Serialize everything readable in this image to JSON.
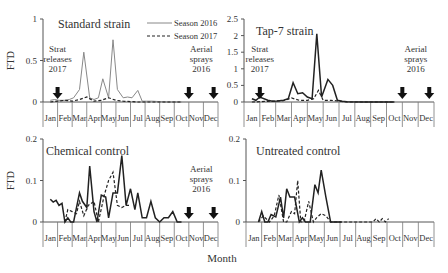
{
  "figure": {
    "xlabel": "Month",
    "ylabel": "FTD"
  },
  "legend": {
    "items": [
      {
        "label": "Season 2016",
        "style": "solid-thin",
        "color": "#888888"
      },
      {
        "label": "Season 2017",
        "style": "dashed",
        "color": "#222222"
      }
    ]
  },
  "months": [
    "Jan",
    "Feb",
    "Mar",
    "Apr",
    "May",
    "Jun",
    "Jul",
    "Aug",
    "Sep",
    "Oct",
    "Nov",
    "Dec"
  ],
  "annotations": {
    "strat": [
      "Strat",
      "releases",
      "2017"
    ],
    "aerial": [
      "Aerial",
      "sprays",
      "2016"
    ]
  },
  "chart_data": [
    {
      "type": "line",
      "title": "Standard strain",
      "xlabel": "",
      "ylabel": "FTD",
      "ylim": [
        0,
        1
      ],
      "yticks": [
        "0",
        "0.5",
        "1"
      ],
      "categories": [
        "Jan",
        "Feb",
        "Mar",
        "Apr",
        "May",
        "Jun",
        "Jul",
        "Aug",
        "Sep",
        "Oct",
        "Nov",
        "Dec"
      ],
      "series": [
        {
          "name": "Season 2016",
          "x": [
            0,
            0.3,
            0.6,
            1,
            1.3,
            1.6,
            2,
            2.3,
            2.7,
            3,
            3.3,
            3.6,
            4,
            4.3,
            4.6,
            5,
            5.3,
            5.6,
            6,
            6.3,
            6.6,
            7,
            8,
            9
          ],
          "y": [
            0.02,
            0.03,
            0.02,
            0.02,
            0.03,
            0.05,
            0.15,
            0.6,
            0.05,
            0.03,
            0.05,
            0.28,
            0.05,
            0.75,
            0.15,
            0.05,
            0.06,
            0.05,
            0.14,
            0.01,
            0.01,
            0.01,
            0.0,
            0.0
          ]
        },
        {
          "name": "Season 2017",
          "x": [
            0,
            0.5,
            1,
            1.5,
            2,
            2.5,
            3,
            3.5,
            4,
            4.5,
            5,
            6,
            9
          ],
          "y": [
            0.0,
            0.01,
            0.02,
            0.01,
            0.03,
            0.06,
            0.01,
            0.02,
            0.05,
            0.02,
            0.01,
            0.0,
            0.0
          ]
        }
      ],
      "annotations": [
        "Strat releases 2017 (arrow at Feb)",
        "Aerial sprays 2016 (arrows at Nov, Dec)"
      ]
    },
    {
      "type": "line",
      "title": "Tap-7 strain",
      "xlabel": "",
      "ylabel": "",
      "ylim": [
        0,
        2.5
      ],
      "yticks": [
        "0",
        "0.5",
        "1",
        "1.5",
        "2",
        "2.5"
      ],
      "categories": [
        "Jan",
        "Feb",
        "Mar",
        "Apr",
        "May",
        "Jun",
        "Jul",
        "Aug",
        "Sep",
        "Oct",
        "Nov",
        "Dec"
      ],
      "series": [
        {
          "name": "Season 2016",
          "x": [
            0,
            0.25,
            0.5,
            1,
            1.3,
            1.6,
            2,
            2.3,
            2.6,
            2.9,
            3.2,
            3.5,
            3.8,
            4.1,
            4.4,
            4.8,
            5.1,
            5.4,
            5.7,
            6,
            7,
            9
          ],
          "y": [
            0.1,
            0.05,
            0.15,
            0.05,
            0.02,
            0.03,
            0.05,
            0.1,
            0.58,
            0.25,
            0.28,
            0.15,
            0.1,
            2.05,
            0.15,
            0.68,
            0.5,
            0.05,
            0.02,
            0.01,
            0.0,
            0.0
          ]
        },
        {
          "name": "Season 2017",
          "x": [
            0,
            1,
            2,
            2.5,
            3,
            3.5,
            3.9,
            4.2,
            4.5,
            5,
            6,
            9
          ],
          "y": [
            0.0,
            0.02,
            0.04,
            0.12,
            0.05,
            0.05,
            0.1,
            0.35,
            0.05,
            0.05,
            0.0,
            0.0
          ]
        }
      ],
      "annotations": [
        "Strat releases 2017 (arrow at Feb)",
        "Aerial sprays 2016 (arrows at Nov, Dec)"
      ]
    },
    {
      "type": "line",
      "title": "Chemical control",
      "xlabel": "",
      "ylabel": "FTD",
      "ylim": [
        0,
        0.2
      ],
      "yticks": [
        "0",
        "0.1",
        "0.2"
      ],
      "categories": [
        "Jan",
        "Feb",
        "Mar",
        "Apr",
        "May",
        "Jun",
        "Jul",
        "Aug",
        "Sep",
        "Oct",
        "Nov",
        "Dec"
      ],
      "series": [
        {
          "name": "Season 2016",
          "x": [
            0,
            0.2,
            0.4,
            0.6,
            0.8,
            1,
            1.2,
            1.4,
            1.6,
            2,
            2.2,
            2.5,
            2.7,
            3,
            3.2,
            3.5,
            3.8,
            4,
            4.3,
            4.6,
            4.9,
            5.2,
            5.5,
            5.8,
            6,
            6.3,
            6.6,
            6.9,
            7.2,
            7.5,
            7.8,
            8.1,
            8.4,
            8.7,
            9
          ],
          "y": [
            0.055,
            0.048,
            0.052,
            0.04,
            0.045,
            0.0,
            0.01,
            0.0,
            0.0,
            0.07,
            0.05,
            0.035,
            0.135,
            0.025,
            0.0,
            0.065,
            0.06,
            0.01,
            0.07,
            0.07,
            0.16,
            0.04,
            0.08,
            0.03,
            0.07,
            0.01,
            0.01,
            0.05,
            0.01,
            0.0,
            0.01,
            0.01,
            0.025,
            0.0,
            0.0
          ]
        },
        {
          "name": "Season 2017",
          "x": [
            1,
            1.2,
            1.5,
            1.8,
            2,
            2.3,
            2.6,
            3,
            3.3,
            3.7,
            4,
            4.3,
            4.6,
            4.9,
            5.2,
            5.4
          ],
          "y": [
            0.0,
            0.03,
            0.025,
            0.02,
            0.05,
            0.015,
            0.04,
            0.05,
            0.0,
            0.065,
            0.1,
            0.12,
            0.04,
            0.035,
            0.04,
            0.04
          ]
        }
      ],
      "annotations": [
        "Aerial sprays 2016 (arrows at Nov, Dec)"
      ]
    },
    {
      "type": "line",
      "title": "Untreated control",
      "xlabel": "Month",
      "ylabel": "",
      "ylim": [
        0,
        0.2
      ],
      "yticks": [
        "0",
        "0.1",
        "0.2"
      ],
      "categories": [
        "Jan",
        "Feb",
        "Mar",
        "Apr",
        "May",
        "Jun",
        "Jul",
        "Aug",
        "Sep",
        "Oct",
        "Nov",
        "Dec"
      ],
      "series": [
        {
          "name": "Season 2016",
          "x": [
            0.3,
            0.5,
            0.7,
            0.9,
            1.1,
            1.4,
            1.7,
            1.9,
            2.1,
            2.3,
            2.6,
            2.9,
            3.1,
            3.3,
            3.6,
            3.9,
            4.1,
            4.3,
            4.6,
            4.9,
            5.3,
            5.6
          ],
          "y": [
            0.0,
            0.025,
            0.0,
            0.0,
            0.018,
            0.012,
            0.06,
            0.01,
            0.08,
            0.06,
            0.06,
            0.0,
            0.01,
            0.0,
            0.0,
            0.09,
            0.07,
            0.125,
            0.06,
            0.0,
            0.0,
            0.0
          ]
        },
        {
          "name": "Season 2017",
          "x": [
            0.3,
            0.6,
            1,
            1.3,
            1.6,
            1.9,
            2.1,
            2.4,
            2.6,
            2.8,
            3,
            3.2,
            3.5,
            3.8,
            4,
            4.3,
            4.6,
            4.9,
            5.2,
            7.6,
            7.8,
            8,
            8.2,
            8.4,
            8.6
          ],
          "y": [
            0.0,
            0.015,
            0.0,
            0.015,
            0.065,
            0.0,
            0.0,
            0.025,
            0.02,
            0.1,
            0.0,
            0.0,
            0.05,
            0.0,
            0.01,
            0.02,
            0.015,
            0.0,
            0.0,
            0.0,
            0.008,
            0.0,
            0.008,
            0.0,
            0.008
          ]
        }
      ]
    }
  ]
}
